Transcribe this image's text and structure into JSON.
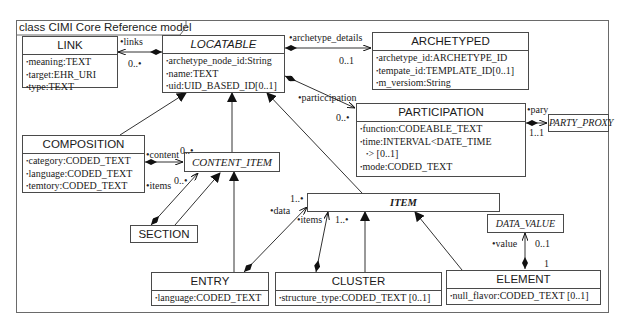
{
  "diagram": {
    "title": "class CIMI Core Reference model",
    "classes": {
      "link": {
        "name": "LINK",
        "attributes": [
          "meaning:TEXT",
          "target:EHR_URI",
          "type:TEXT"
        ]
      },
      "locatable": {
        "name": "LOCATABLE",
        "abstract": true,
        "attributes": [
          "archetype_node_id:String",
          "name:TEXT",
          "uid:UID_BASED_ID[0..1]"
        ]
      },
      "archetyped": {
        "name": "ARCHETYPED",
        "attributes": [
          "archetype_id:ARCHETYPE_ID",
          "tempate_id:TEMPLATE_ID[0..1]",
          "m_versiom:String"
        ]
      },
      "participation": {
        "name": "PARTICIPATION",
        "attributes": [
          "function:CODEABLE_TEXT",
          "time:INTERVAL<DATE_TIME",
          "> [0..1]",
          "mode:CODED_TEXT"
        ]
      },
      "party_proxy": {
        "name": "PARTY_PROXY",
        "abstract": true
      },
      "composition": {
        "name": "COMPOSITION",
        "attributes": [
          "category:CODED_TEXT",
          "language:CODED_TEXT",
          "temtory:CODED_TEXT"
        ]
      },
      "content_item": {
        "name": "CONTENT_ITEM",
        "abstract": true
      },
      "section": {
        "name": "SECTION"
      },
      "item": {
        "name": "ITEM",
        "abstract": true
      },
      "data_value": {
        "name": "DATA_VALUE",
        "abstract": true
      },
      "entry": {
        "name": "ENTRY",
        "attributes": [
          "language:CODED_TEXT"
        ]
      },
      "cluster": {
        "name": "CLUSTER",
        "attributes": [
          "structure_type:CODED_TEXT [0..1]"
        ]
      },
      "element": {
        "name": "ELEMENT",
        "attributes": [
          "null_flavor:CODED_TEXT [0..1]"
        ]
      }
    },
    "labels": {
      "links_role": "•links",
      "links_mult": "0..•",
      "archetype_details_role": "•archetype_details",
      "archetype_details_mult": "0..1",
      "participation_role": "•particcipation",
      "participation_mult": "0..•",
      "pary_role": "•pary",
      "pary_mult": "1..1",
      "content_role": "•content",
      "content_mult": "0..•",
      "items_section_role": "•items",
      "items_section_mult": "0..•",
      "data_role": "•data",
      "data_mult": "1..•",
      "items_cluster_role": "•items",
      "items_cluster_mult": "1..•",
      "value_role": "•value",
      "value_mult": "0..1",
      "value_owner_mult": "1"
    }
  }
}
